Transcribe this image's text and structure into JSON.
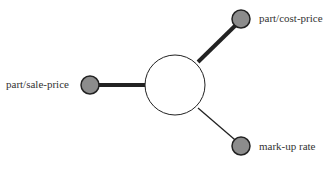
{
  "diagram": {
    "center": {
      "label": ""
    },
    "nodes": [
      {
        "id": "cost",
        "label": "part/cost-price",
        "edge": "thick"
      },
      {
        "id": "sale",
        "label": "part/sale-price",
        "edge": "thick"
      },
      {
        "id": "markup",
        "label": "mark-up rate",
        "edge": "thin"
      }
    ],
    "colors": {
      "node_fill": "#8c8c8c",
      "stroke": "#222222",
      "center_fill": "#ffffff"
    }
  }
}
